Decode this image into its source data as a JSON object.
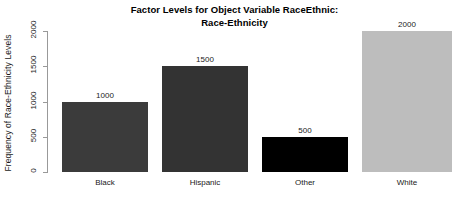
{
  "chart_data": {
    "type": "bar",
    "title": "Factor Levels for Object Variable RaceEthnic:\nRace-Ethnicity",
    "title_line1": "Factor Levels for Object Variable RaceEthnic:",
    "title_line2": "Race-Ethnicity",
    "xlabel": "",
    "ylabel": "Frequency of Race-Ethnicity Levels",
    "categories": [
      "Black",
      "Hispanic",
      "Other",
      "White"
    ],
    "values": [
      1000,
      1500,
      500,
      2000
    ],
    "value_labels": [
      "1000",
      "1500",
      "500",
      "2000"
    ],
    "bar_colors": [
      "#3b3b3b",
      "#333333",
      "#000000",
      "#bdbdbd"
    ],
    "ylim": [
      0,
      2000
    ],
    "yticks": [
      0,
      500,
      1000,
      1500,
      2000
    ],
    "ytick_labels": [
      "0",
      "500",
      "1000",
      "1500",
      "2000"
    ],
    "grid": false,
    "legend": null,
    "background": "#ffffff",
    "axis_color": "#999999"
  }
}
